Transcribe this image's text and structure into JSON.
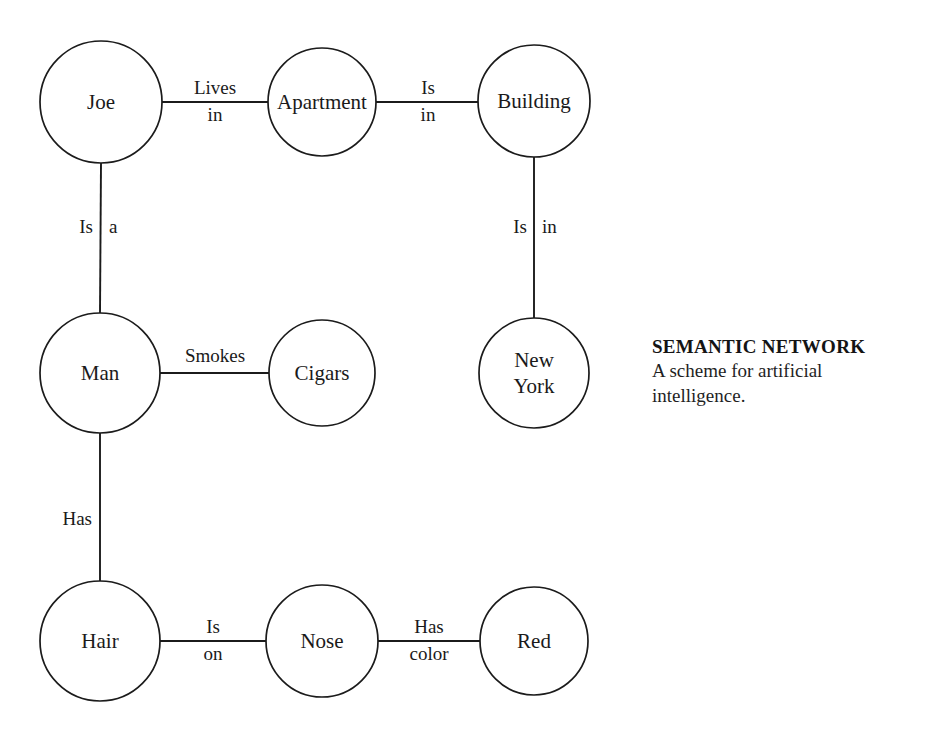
{
  "page": {
    "background_color": "#ffffff",
    "ink_color": "#1b1b1b",
    "top_clipped_text": "SEMANTIC NETWORK"
  },
  "caption": {
    "title": "SEMANTIC NETWORK",
    "line1": "A scheme for artificial",
    "line2": "intelligence."
  },
  "diagram": {
    "nodes": [
      {
        "id": "joe",
        "label": "Joe",
        "label_lines": [
          "Joe"
        ],
        "cx": 101,
        "cy": 102,
        "r": 61
      },
      {
        "id": "apartment",
        "label": "Apartment",
        "label_lines": [
          "Apartment"
        ],
        "cx": 322,
        "cy": 102,
        "r": 54
      },
      {
        "id": "building",
        "label": "Building",
        "label_lines": [
          "Building"
        ],
        "cx": 534,
        "cy": 101,
        "r": 56
      },
      {
        "id": "man",
        "label": "Man",
        "label_lines": [
          "Man"
        ],
        "cx": 100,
        "cy": 373,
        "r": 60
      },
      {
        "id": "cigars",
        "label": "Cigars",
        "label_lines": [
          "Cigars"
        ],
        "cx": 322,
        "cy": 373,
        "r": 53
      },
      {
        "id": "newyork",
        "label": "New York",
        "label_lines": [
          "New",
          "York"
        ],
        "cx": 534,
        "cy": 373,
        "r": 55
      },
      {
        "id": "hair",
        "label": "Hair",
        "label_lines": [
          "Hair"
        ],
        "cx": 100,
        "cy": 641,
        "r": 60
      },
      {
        "id": "nose",
        "label": "Nose",
        "label_lines": [
          "Nose"
        ],
        "cx": 322,
        "cy": 641,
        "r": 56
      },
      {
        "id": "red",
        "label": "Red",
        "label_lines": [
          "Red"
        ],
        "cx": 534,
        "cy": 641,
        "r": 54
      }
    ],
    "edges": [
      {
        "id": "joe-lives-in-apartment",
        "from": "joe",
        "to": "apartment",
        "label": "Lives in",
        "orientation": "horizontal",
        "x1": 162,
        "y1": 102,
        "x2": 268,
        "y2": 102,
        "label_layout": "stacked",
        "top_word": "Lives",
        "bottom_word": "in",
        "label_x": 215,
        "top_y": 90,
        "bottom_y": 117
      },
      {
        "id": "apartment-is-in-building",
        "from": "apartment",
        "to": "building",
        "label": "Is in",
        "orientation": "horizontal",
        "x1": 376,
        "y1": 102,
        "x2": 478,
        "y2": 102,
        "label_layout": "stacked",
        "top_word": "Is",
        "bottom_word": "in",
        "label_x": 428,
        "top_y": 90,
        "bottom_y": 117
      },
      {
        "id": "building-is-in-newyork",
        "from": "building",
        "to": "newyork",
        "label": "Is in",
        "orientation": "vertical",
        "x1": 534,
        "y1": 157,
        "x2": 534,
        "y2": 318,
        "label_layout": "split",
        "left_word": "Is",
        "right_word": "in",
        "label_y": 229,
        "left_x": 527,
        "right_x": 542
      },
      {
        "id": "joe-is-a-man",
        "from": "joe",
        "to": "man",
        "label": "Is a",
        "orientation": "vertical",
        "x1": 101,
        "y1": 163,
        "x2": 100,
        "y2": 313,
        "label_layout": "split",
        "left_word": "Is",
        "right_word": "a",
        "label_y": 229,
        "left_x": 93,
        "right_x": 109
      },
      {
        "id": "man-smokes-cigars",
        "from": "man",
        "to": "cigars",
        "label": "Smokes",
        "orientation": "horizontal",
        "x1": 160,
        "y1": 373,
        "x2": 269,
        "y2": 373,
        "label_layout": "above",
        "label_x": 215,
        "label_y": 358
      },
      {
        "id": "man-has-hair",
        "from": "man",
        "to": "hair",
        "label": "Has",
        "orientation": "vertical",
        "x1": 100,
        "y1": 433,
        "x2": 100,
        "y2": 581,
        "label_layout": "left",
        "label_x": 92,
        "label_y": 521
      },
      {
        "id": "hair-is-on-nose",
        "from": "hair",
        "to": "nose",
        "label": "Is on",
        "orientation": "horizontal",
        "x1": 160,
        "y1": 641,
        "x2": 266,
        "y2": 641,
        "label_layout": "stacked",
        "top_word": "Is",
        "bottom_word": "on",
        "label_x": 213,
        "top_y": 629,
        "bottom_y": 656
      },
      {
        "id": "nose-has-color-red",
        "from": "nose",
        "to": "red",
        "label": "Has color",
        "orientation": "horizontal",
        "x1": 378,
        "y1": 641,
        "x2": 480,
        "y2": 641,
        "label_layout": "stacked",
        "top_word": "Has",
        "bottom_word": "color",
        "label_x": 429,
        "top_y": 629,
        "bottom_y": 656
      }
    ]
  }
}
